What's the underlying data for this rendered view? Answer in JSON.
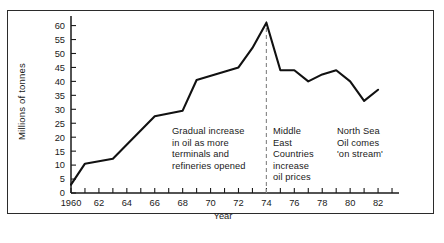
{
  "chart_data": {
    "type": "line",
    "title": "",
    "xlabel": "Year",
    "ylabel": "Millions of tonnes",
    "xlim": [
      1960,
      1983.5
    ],
    "ylim": [
      0,
      62
    ],
    "grid": false,
    "legend": "none",
    "y_ticks": [
      0,
      5,
      10,
      15,
      20,
      25,
      30,
      35,
      40,
      45,
      50,
      55,
      60
    ],
    "y_tick_labels": [
      "0",
      "5",
      "10",
      "15",
      "20",
      "25",
      "30",
      "35",
      "40",
      "45",
      "50",
      "55",
      "60"
    ],
    "x_ticks": [
      1960,
      1961,
      1962,
      1963,
      1964,
      1965,
      1966,
      1967,
      1968,
      1969,
      1970,
      1971,
      1972,
      1973,
      1974,
      1975,
      1976,
      1977,
      1978,
      1979,
      1980,
      1981,
      1982,
      1983
    ],
    "x_tick_labels": [
      "1960",
      "",
      "62",
      "",
      "64",
      "",
      "66",
      "",
      "68",
      "",
      "70",
      "",
      "72",
      "",
      "74",
      "",
      "76",
      "",
      "78",
      "",
      "80",
      "",
      "82",
      ""
    ],
    "x": [
      1960,
      1961,
      1963,
      1966,
      1967,
      1968,
      1969,
      1972,
      1973,
      1974,
      1975,
      1976,
      1977,
      1978,
      1979,
      1980,
      1981,
      1982
    ],
    "values": [
      3,
      10.5,
      12.3,
      27.5,
      28.5,
      29.5,
      40.5,
      45,
      52,
      61,
      44,
      44,
      40,
      42.5,
      44,
      40,
      33,
      37
    ],
    "series": [
      {
        "name": "Oil (millions of tonnes)",
        "x": [
          1960,
          1961,
          1963,
          1966,
          1967,
          1968,
          1969,
          1972,
          1973,
          1974,
          1975,
          1976,
          1977,
          1978,
          1979,
          1980,
          1981,
          1982
        ],
        "values": [
          3,
          10.5,
          12.3,
          27.5,
          28.5,
          29.5,
          40.5,
          45,
          52,
          61,
          44,
          44,
          40,
          42.5,
          44,
          40,
          33,
          37
        ]
      }
    ],
    "markers": [
      {
        "name": "dashed-vertical-1974",
        "x": 1974,
        "style": "dashed",
        "color": "#8c8c8c"
      }
    ],
    "annotations": [
      {
        "name": "gradual-increase",
        "text": "Gradual increase\nin oil as more\nterminals and\nrefineries opened",
        "x": 1966.6,
        "y": 24
      },
      {
        "name": "middle-east",
        "text": "Middle\nEast\nCountries\nincrease\noil prices",
        "x": 1974.4,
        "y": 24
      },
      {
        "name": "north-sea",
        "text": "North Sea\nOil comes\n'on stream'",
        "x": 1978.2,
        "y": 24
      }
    ],
    "line_color": "#111111",
    "axis_color": "#1a1a1a"
  },
  "axes": {
    "y_title": "Millions of tonnes",
    "x_title": "Year"
  }
}
